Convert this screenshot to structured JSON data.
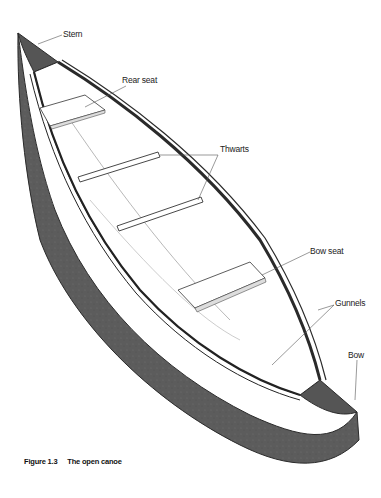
{
  "figure": {
    "title": "The open canoe",
    "number": "Figure 1.3",
    "colors": {
      "hull": "#5a5a5a",
      "hull_dark": "#3a3a3a",
      "gunnel": "#2a2a2a",
      "interior": "#ffffff",
      "line": "#333333",
      "leader": "#555555"
    }
  },
  "labels": {
    "stern": "Stern",
    "rear_seat": "Rear seat",
    "thwarts": "Thwarts",
    "bow_seat": "Bow seat",
    "gunnels": "Gunnels",
    "bow": "Bow"
  },
  "caption": {
    "number": "Figure 1.3",
    "text": "The open canoe"
  }
}
